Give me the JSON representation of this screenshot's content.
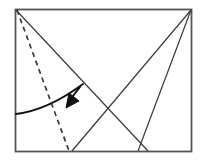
{
  "figure": {
    "canvas": {
      "width": 207,
      "height": 161,
      "background": "#ffffff"
    },
    "colors": {
      "stroke": "#3a3a3a",
      "border": "#555555",
      "dashed": "#3a3a3a",
      "arrow": "#101010",
      "background": "#ffffff"
    },
    "sheet": {
      "name": "paper-sheet-rectangle",
      "x": 15.5,
      "y": 9.5,
      "width": 176,
      "height": 142,
      "stroke_width": 1.8
    },
    "creases": [
      {
        "name": "crease-top-left-to-bottom",
        "style": "solid",
        "x1": 16,
        "y1": 10,
        "x2": 148,
        "y2": 151
      },
      {
        "name": "crease-top-right-to-bottom-left",
        "style": "solid",
        "x1": 191,
        "y1": 10,
        "x2": 72,
        "y2": 151
      },
      {
        "name": "crease-top-right-to-bottom",
        "style": "solid",
        "x1": 191,
        "y1": 10,
        "x2": 138,
        "y2": 151
      }
    ],
    "fold_line": {
      "name": "fold-crease-dashed",
      "style": "dashed",
      "x1": 17,
      "y1": 10,
      "x2": 69,
      "y2": 151,
      "dash_pattern": "5,4",
      "stroke_width": 1.7
    },
    "motion_arrow": {
      "name": "fold-direction-arrow",
      "path": "M 16,114 Q 48,110 83,84",
      "stroke_width": 2.0,
      "head": {
        "name": "arrowhead",
        "tip_x": 66,
        "tip_y": 108,
        "points": "66,108 69,93 79,101"
      },
      "head_stem": {
        "x1": 80,
        "y1": 87,
        "x2": 69,
        "y2": 101
      }
    }
  }
}
